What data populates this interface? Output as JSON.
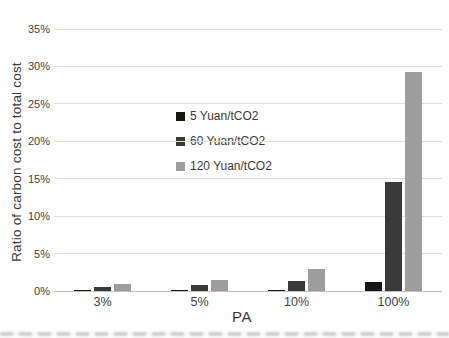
{
  "chart_data": {
    "type": "bar",
    "title": "",
    "xlabel": "PA",
    "ylabel": "Ratio of carbon cost to total cost",
    "categories": [
      "3%",
      "5%",
      "10%",
      "100%"
    ],
    "series": [
      {
        "name": "5 Yuan/tCO2",
        "color": "#161616",
        "values": [
          0.1,
          0.1,
          0.15,
          1.2
        ]
      },
      {
        "name": "60 Yuan/tCO2",
        "color": "#3a3a3a",
        "values": [
          0.5,
          0.8,
          1.4,
          14.6
        ]
      },
      {
        "name": "120 Yuan/tCO2",
        "color": "#9e9e9e",
        "values": [
          0.9,
          1.5,
          2.9,
          29.3
        ]
      }
    ],
    "ylim": [
      0,
      35
    ],
    "ytick_step": 5,
    "ytick_labels": [
      "0%",
      "5%",
      "10%",
      "15%",
      "20%",
      "25%",
      "30%",
      "35%"
    ],
    "grid": true,
    "legend_position": "inside-left-middle"
  },
  "colors": {
    "gridline": "#dedede",
    "axis": "#c2c2c2",
    "text": "#3c3c3c",
    "background": "#ffffff"
  }
}
